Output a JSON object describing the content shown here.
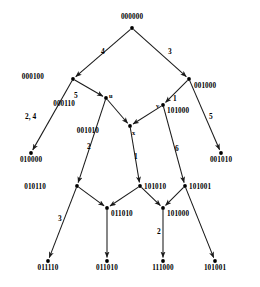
{
  "diagram": {
    "type": "directed-graph",
    "title": "",
    "nodes": [
      {
        "id": "n0",
        "label": "000000",
        "vertex": "",
        "x": 132,
        "y": 28,
        "label_pos": "above",
        "lx": 132,
        "ly": 14
      },
      {
        "id": "n1",
        "label": "000100",
        "vertex": "",
        "x": 73,
        "y": 79,
        "label_pos": "left",
        "lx": 44,
        "ly": 74
      },
      {
        "id": "n2",
        "label": "001000",
        "vertex": "",
        "x": 189,
        "y": 79,
        "label_pos": "right",
        "lx": 194,
        "ly": 83
      },
      {
        "id": "n3",
        "label": "000110",
        "vertex": "u",
        "x": 106,
        "y": 98,
        "label_pos": "left",
        "lx": 75,
        "ly": 101
      },
      {
        "id": "n4",
        "label": "101000",
        "vertex": "v",
        "x": 163,
        "y": 105,
        "label_pos": "right",
        "lx": 167,
        "ly": 108
      },
      {
        "id": "n5",
        "label": "010000",
        "vertex": "",
        "x": 31,
        "y": 153,
        "label_pos": "below",
        "lx": 31,
        "ly": 157
      },
      {
        "id": "n6",
        "label": "001010",
        "vertex": "x",
        "x": 130,
        "y": 126,
        "label_pos": "left",
        "lx": 99,
        "ly": 128
      },
      {
        "id": "n7",
        "label": "001010",
        "vertex": "",
        "x": 221,
        "y": 153,
        "label_pos": "below",
        "lx": 221,
        "ly": 157
      },
      {
        "id": "n8",
        "label": "010110",
        "vertex": "",
        "x": 77,
        "y": 186,
        "label_pos": "left",
        "lx": 46,
        "ly": 184
      },
      {
        "id": "n9",
        "label": "101010",
        "vertex": "",
        "x": 140,
        "y": 186,
        "label_pos": "right",
        "lx": 144,
        "ly": 184
      },
      {
        "id": "n10",
        "label": "101001",
        "vertex": "",
        "x": 185,
        "y": 186,
        "label_pos": "right",
        "lx": 189,
        "ly": 184
      },
      {
        "id": "n11",
        "label": "011010",
        "vertex": "",
        "x": 107,
        "y": 208,
        "label_pos": "right",
        "lx": 111,
        "ly": 211
      },
      {
        "id": "n12",
        "label": "101000",
        "vertex": "",
        "x": 163,
        "y": 208,
        "label_pos": "right",
        "lx": 167,
        "ly": 211
      },
      {
        "id": "n13",
        "label": "011110",
        "vertex": "",
        "x": 48,
        "y": 261,
        "label_pos": "below",
        "lx": 48,
        "ly": 265
      },
      {
        "id": "n14",
        "label": "011010",
        "vertex": "",
        "x": 107,
        "y": 261,
        "label_pos": "below",
        "lx": 107,
        "ly": 265
      },
      {
        "id": "n15",
        "label": "111000",
        "vertex": "",
        "x": 163,
        "y": 261,
        "label_pos": "below",
        "lx": 163,
        "ly": 265
      },
      {
        "id": "n16",
        "label": "101001",
        "vertex": "",
        "x": 215,
        "y": 261,
        "label_pos": "below",
        "lx": 215,
        "ly": 265
      }
    ],
    "edges": [
      {
        "from": "n0",
        "to": "n1",
        "weight": "4",
        "wx": 101,
        "wy": 48
      },
      {
        "from": "n0",
        "to": "n2",
        "weight": "3",
        "wx": 168,
        "wy": 48
      },
      {
        "from": "n1",
        "to": "n5",
        "weight": "2, 4",
        "wx": 25,
        "wy": 113
      },
      {
        "from": "n1",
        "to": "n3",
        "weight": "5",
        "wx": 74,
        "wy": 92
      },
      {
        "from": "n2",
        "to": "n4",
        "weight": "1",
        "wx": 173,
        "wy": 95
      },
      {
        "from": "n2",
        "to": "n7",
        "weight": "5",
        "wx": 209,
        "wy": 113
      },
      {
        "from": "n3",
        "to": "n6",
        "weight": "",
        "wx": 0,
        "wy": 0
      },
      {
        "from": "n3",
        "to": "n8",
        "weight": "2",
        "wx": 87,
        "wy": 143
      },
      {
        "from": "n4",
        "to": "n6",
        "weight": "",
        "wx": 0,
        "wy": 0
      },
      {
        "from": "n4",
        "to": "n10",
        "weight": "6",
        "wx": 175,
        "wy": 145
      },
      {
        "from": "n6",
        "to": "n9",
        "weight": "1",
        "wx": 134,
        "wy": 153
      },
      {
        "from": "n8",
        "to": "n13",
        "weight": "3",
        "wx": 58,
        "wy": 215
      },
      {
        "from": "n8",
        "to": "n11",
        "weight": "",
        "wx": 0,
        "wy": 0
      },
      {
        "from": "n9",
        "to": "n11",
        "weight": "",
        "wx": 0,
        "wy": 0
      },
      {
        "from": "n9",
        "to": "n12",
        "weight": "",
        "wx": 0,
        "wy": 0
      },
      {
        "from": "n10",
        "to": "n12",
        "weight": "",
        "wx": 0,
        "wy": 0
      },
      {
        "from": "n10",
        "to": "n16",
        "weight": "",
        "wx": 0,
        "wy": 0
      },
      {
        "from": "n11",
        "to": "n14",
        "weight": "",
        "wx": 0,
        "wy": 0
      },
      {
        "from": "n12",
        "to": "n15",
        "weight": "2",
        "wx": 157,
        "wy": 228
      }
    ],
    "vertex_markers": [
      {
        "name": "u",
        "x": 109,
        "y": 93
      },
      {
        "name": "v",
        "x": 156,
        "y": 103
      },
      {
        "name": "x",
        "x": 132,
        "y": 130
      }
    ],
    "colors": {
      "edge": "#1a1a1a",
      "node": "#000000",
      "background": "#ffffff"
    }
  }
}
